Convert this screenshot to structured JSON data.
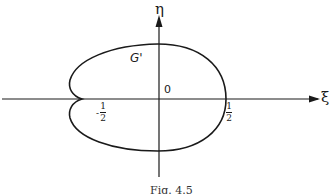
{
  "figure": {
    "caption": "Fig. 4.5",
    "axes": {
      "x_label": "ξ",
      "y_label": "η",
      "origin_label": "0"
    },
    "region_label": "G'",
    "ticks": {
      "left": {
        "sign": "-",
        "numerator": "1",
        "denominator": "2"
      },
      "right": {
        "numerator": "1",
        "denominator": "2"
      }
    },
    "colors": {
      "ink": "#1a1a1a",
      "background": "#ffffff"
    }
  }
}
